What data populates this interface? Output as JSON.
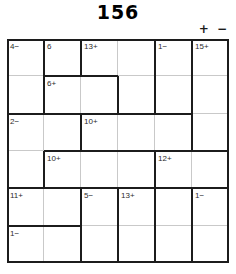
{
  "puzzle": {
    "title": "156",
    "operators_legend": "+ −",
    "grid_size": 6,
    "columns": 6,
    "rows": 6,
    "colors": {
      "cage_border": "#1c1c1c",
      "cell_grid": "#c9c9c9",
      "text": "#2b2b2b",
      "background": "#ffffff"
    },
    "cages": [
      {
        "id": "cage-4-minus",
        "label": "4−",
        "target": 4,
        "operator": "−",
        "label_cell": {
          "row": 1,
          "col": 1
        },
        "cells": [
          [
            1,
            1
          ],
          [
            2,
            1
          ]
        ]
      },
      {
        "id": "cage-6",
        "label": "6",
        "target": 6,
        "operator": "",
        "label_cell": {
          "row": 1,
          "col": 2
        },
        "cells": [
          [
            1,
            2
          ]
        ]
      },
      {
        "id": "cage-13-plus",
        "label": "13+",
        "target": 13,
        "operator": "+",
        "label_cell": {
          "row": 1,
          "col": 3
        },
        "cells": [
          [
            1,
            3
          ],
          [
            1,
            4
          ],
          [
            2,
            4
          ]
        ]
      },
      {
        "id": "cage-1-minus-a",
        "label": "1−",
        "target": 1,
        "operator": "−",
        "label_cell": {
          "row": 1,
          "col": 5
        },
        "cells": [
          [
            1,
            5
          ],
          [
            2,
            5
          ]
        ]
      },
      {
        "id": "cage-15-plus",
        "label": "15+",
        "target": 15,
        "operator": "+",
        "label_cell": {
          "row": 1,
          "col": 6
        },
        "cells": [
          [
            1,
            6
          ],
          [
            2,
            6
          ],
          [
            3,
            6
          ]
        ]
      },
      {
        "id": "cage-6-plus",
        "label": "6+",
        "target": 6,
        "operator": "+",
        "label_cell": {
          "row": 2,
          "col": 2
        },
        "cells": [
          [
            2,
            2
          ],
          [
            2,
            3
          ]
        ]
      },
      {
        "id": "cage-2-minus",
        "label": "2−",
        "target": 2,
        "operator": "−",
        "label_cell": {
          "row": 3,
          "col": 1
        },
        "cells": [
          [
            3,
            1
          ],
          [
            3,
            2
          ],
          [
            4,
            1
          ]
        ]
      },
      {
        "id": "cage-10-plus-a",
        "label": "10+",
        "target": 10,
        "operator": "+",
        "label_cell": {
          "row": 3,
          "col": 3
        },
        "cells": [
          [
            3,
            3
          ],
          [
            3,
            4
          ],
          [
            3,
            5
          ]
        ]
      },
      {
        "id": "cage-10-plus-b",
        "label": "10+",
        "target": 10,
        "operator": "+",
        "label_cell": {
          "row": 4,
          "col": 2
        },
        "cells": [
          [
            4,
            2
          ],
          [
            4,
            3
          ],
          [
            4,
            4
          ]
        ]
      },
      {
        "id": "cage-12-plus",
        "label": "12+",
        "target": 12,
        "operator": "+",
        "label_cell": {
          "row": 4,
          "col": 5
        },
        "cells": [
          [
            4,
            5
          ],
          [
            4,
            6
          ]
        ]
      },
      {
        "id": "cage-11-plus",
        "label": "11+",
        "target": 11,
        "operator": "+",
        "label_cell": {
          "row": 5,
          "col": 1
        },
        "cells": [
          [
            5,
            1
          ],
          [
            5,
            2
          ]
        ]
      },
      {
        "id": "cage-5-minus",
        "label": "5−",
        "target": 5,
        "operator": "−",
        "label_cell": {
          "row": 5,
          "col": 3
        },
        "cells": [
          [
            5,
            3
          ],
          [
            6,
            3
          ]
        ]
      },
      {
        "id": "cage-13-plus-b",
        "label": "13+",
        "target": 13,
        "operator": "+",
        "label_cell": {
          "row": 5,
          "col": 4
        },
        "cells": [
          [
            5,
            4
          ],
          [
            6,
            4
          ]
        ]
      },
      {
        "id": "cage-5-6-block",
        "label": "",
        "target": null,
        "operator": "",
        "label_cell": null,
        "cells": [
          [
            5,
            5
          ],
          [
            6,
            5
          ]
        ]
      },
      {
        "id": "cage-1-minus-b",
        "label": "1−",
        "target": 1,
        "operator": "−",
        "label_cell": {
          "row": 5,
          "col": 6
        },
        "cells": [
          [
            5,
            6
          ],
          [
            6,
            6
          ]
        ]
      },
      {
        "id": "cage-1-minus-c",
        "label": "1−",
        "target": 1,
        "operator": "−",
        "label_cell": {
          "row": 6,
          "col": 1
        },
        "cells": [
          [
            6,
            1
          ],
          [
            6,
            2
          ]
        ]
      }
    ],
    "cage_labels": {
      "r1c1": "4−",
      "r1c2": "6",
      "r1c3": "13+",
      "r1c5": "1−",
      "r1c6": "15+",
      "r2c2": "6+",
      "r3c1": "2−",
      "r3c3": "10+",
      "r4c2": "10+",
      "r4c5": "12+",
      "r5c1": "11+",
      "r5c3": "5−",
      "r5c4": "13+",
      "r5c6": "1−",
      "r6c1": "1−"
    }
  }
}
